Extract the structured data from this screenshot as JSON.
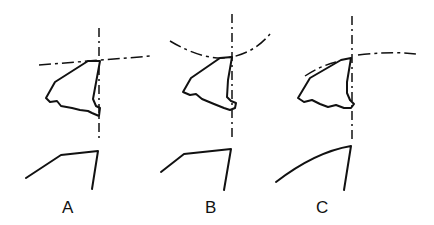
{
  "figure": {
    "panels": [
      {
        "id": "A",
        "label": "A",
        "reference_line": "straight dash-dot line",
        "profile": "angular"
      },
      {
        "id": "B",
        "label": "B",
        "reference_line": "concave dashed arc",
        "profile": "slightly curved"
      },
      {
        "id": "C",
        "label": "C",
        "reference_line": "convex dash-dot arc",
        "profile": "curved"
      }
    ]
  },
  "colors": {
    "ink": "#111111",
    "background": "#ffffff"
  }
}
